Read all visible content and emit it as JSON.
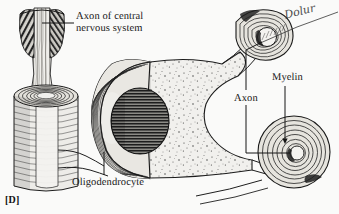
{
  "figure": {
    "panel_letter": "[D]",
    "background_color": "#fdfdfc",
    "ink_color": "#1a1a1a"
  },
  "labels": {
    "axon_of_cns_line1": "Axon of central",
    "axon_of_cns_line2": "nervous system",
    "oligodendrocyte": "Oligodendrocyte",
    "axon": "Axon",
    "myelin": "Myelin"
  },
  "annotation": {
    "handwritten_note": "Dolur"
  },
  "structures": [
    {
      "name": "axon-of-central-nervous-system",
      "description": "vertical striated axon at upper left entering a myelin collar"
    },
    {
      "name": "myelin-sheath-cylinder",
      "description": "cut-away cylinder at lower left showing concentric wrapping lamellae"
    },
    {
      "name": "oligodendrocyte-cell-body",
      "description": "large central cell with ribbed sheath flank, stippled cytoplasm"
    },
    {
      "name": "oligodendrocyte-nucleus",
      "description": "dark oval nucleus with horizontal hatching"
    },
    {
      "name": "myelin-whorl-upper-right",
      "description": "cross-section of myelinated axon, concentric spiral lamellae around pale axoplasm"
    },
    {
      "name": "myelin-whorl-lower-right",
      "description": "cross-section of myelinated axon, concentric spiral lamellae around pale axoplasm"
    },
    {
      "name": "cytoplasmic-process-upper",
      "description": "thin process connecting cell body to upper whorl"
    },
    {
      "name": "cytoplasmic-process-lower",
      "description": "thin process connecting cell body to lower whorl"
    }
  ]
}
